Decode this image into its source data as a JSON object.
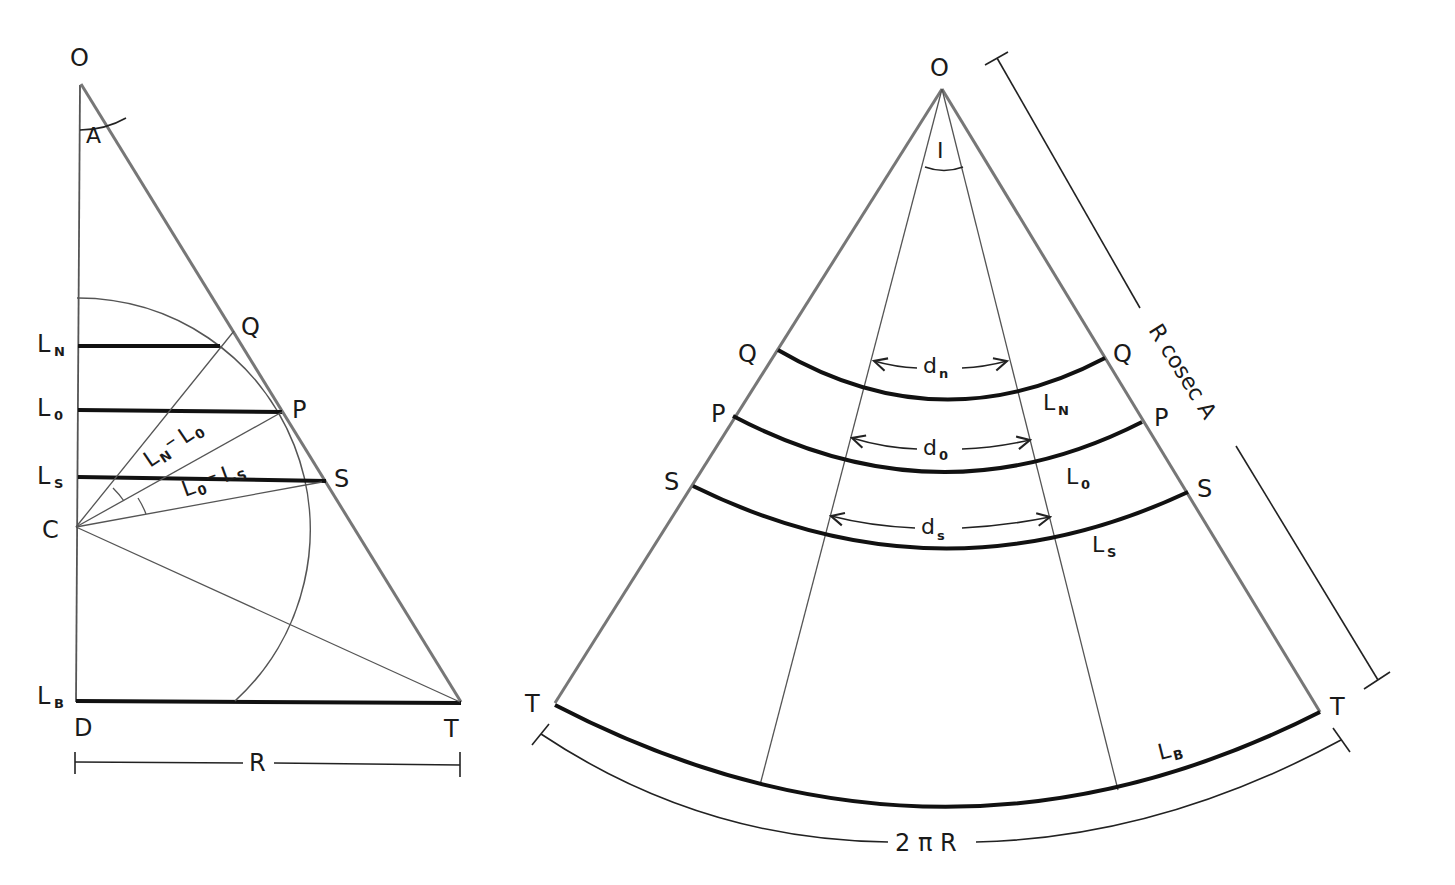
{
  "left_diagram": {
    "points": {
      "O": "O",
      "A": "A",
      "Q": "Q",
      "P": "P",
      "S": "S",
      "C": "C",
      "D": "D",
      "T": "T"
    },
    "latitudes": [
      {
        "base": "L",
        "sub": "N"
      },
      {
        "base": "L",
        "sub": "0"
      },
      {
        "base": "L",
        "sub": "S"
      },
      {
        "base": "L",
        "sub": "B"
      }
    ],
    "angle_labels": {
      "upper": {
        "a": "L",
        "a_sub": "N",
        "dash": "–",
        "b": "L",
        "b_sub": "0"
      },
      "lower": {
        "a": "L",
        "a_sub": "0",
        "dash": "–",
        "b": "L",
        "b_sub": "S"
      }
    },
    "dimension": "R"
  },
  "right_diagram": {
    "points": {
      "O": "O",
      "I": "I",
      "Q_left": "Q",
      "Q_right": "Q",
      "P_left": "P",
      "P_right": "P",
      "S_left": "S",
      "S_right": "S",
      "T_left": "T",
      "T_right": "T"
    },
    "arc_labels": [
      {
        "base": "L",
        "sub": "N"
      },
      {
        "base": "L",
        "sub": "0"
      },
      {
        "base": "L",
        "sub": "S"
      },
      {
        "base": "L",
        "sub": "B"
      }
    ],
    "distances": [
      {
        "base": "d",
        "sub": "n"
      },
      {
        "base": "d",
        "sub": "0"
      },
      {
        "base": "d",
        "sub": "s"
      }
    ],
    "slant_dimension": "R cosec A",
    "arc_dimension": "2 π R"
  }
}
